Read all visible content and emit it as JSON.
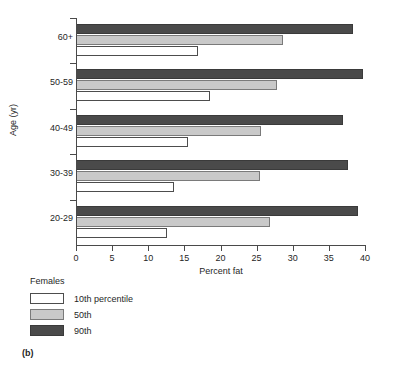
{
  "figure": {
    "panel_label": "(b)"
  },
  "chart_data": {
    "type": "bar",
    "orientation": "horizontal",
    "title": "",
    "xlabel": "Percent fat",
    "ylabel": "Age (yr)",
    "xlim": [
      0,
      40
    ],
    "xticks": [
      0,
      5,
      10,
      15,
      20,
      25,
      30,
      35,
      40
    ],
    "xtick_labels": [
      "0",
      "5",
      "10",
      "15",
      "20",
      "25",
      "30",
      "35",
      "40"
    ],
    "grid": false,
    "categories": [
      "20-29",
      "30-39",
      "40-49",
      "50-59",
      "60+"
    ],
    "category_order_top_to_bottom": [
      "60+",
      "50-59",
      "40-49",
      "30-39",
      "20-29"
    ],
    "legend_title": "Females",
    "legend_position": "below-left",
    "series": [
      {
        "name": "10th percentile",
        "key": "p10",
        "color": "#ffffff",
        "values": [
          12.6,
          13.5,
          15.5,
          18.5,
          16.9
        ]
      },
      {
        "name": "50th",
        "key": "p50",
        "color": "#c9c9c9",
        "values": [
          26.9,
          25.5,
          25.6,
          27.8,
          28.7
        ]
      },
      {
        "name": "90th",
        "key": "p90",
        "color": "#4a4a4a",
        "values": [
          39.1,
          37.7,
          37.0,
          39.7,
          38.4
        ]
      }
    ]
  },
  "legend": {
    "title": "Females",
    "items": [
      {
        "label": "10th percentile",
        "swatch": "p10"
      },
      {
        "label": "50th",
        "swatch": "p50"
      },
      {
        "label": "90th",
        "swatch": "p90"
      }
    ]
  }
}
